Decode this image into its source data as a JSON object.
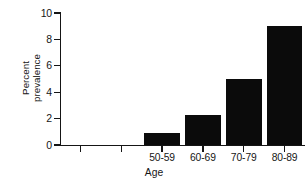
{
  "chart_data": {
    "type": "bar",
    "title": "",
    "xlabel": "Age",
    "ylabel": "Percent prevalence",
    "ylabel_lines": [
      "Percent",
      "prevalence"
    ],
    "categories": [
      "50-59",
      "60-69",
      "70-79",
      "80-89"
    ],
    "values": [
      0.9,
      2.25,
      5.0,
      9.05
    ],
    "ylim": [
      0,
      10
    ],
    "yticks": [
      0,
      2,
      4,
      6,
      8,
      10
    ],
    "ytick_labels": [
      "0",
      "2",
      "4",
      "6",
      "8",
      "10"
    ],
    "grid": false,
    "legend": false,
    "bar_color": "#0b0b0b",
    "axis_color": "#151515",
    "background": "#ffffff",
    "empty_leading_tick_slots": 2
  }
}
